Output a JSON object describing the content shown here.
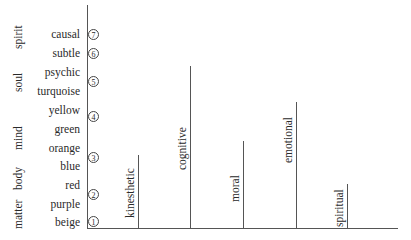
{
  "diagram": {
    "type": "integral-psychograph",
    "quadrants": [
      {
        "label": "spirit",
        "y_top": 7,
        "y_bottom": 6
      },
      {
        "label": "soul",
        "y_top": 5,
        "y_bottom": 5
      },
      {
        "label": "mind",
        "y_top": 4,
        "y_bottom": 3
      },
      {
        "label": "body",
        "y_top": 3,
        "y_bottom": 3
      },
      {
        "label": "matter",
        "y_top": 2,
        "y_bottom": 1
      }
    ],
    "levels": [
      {
        "label": "causal",
        "number": "7"
      },
      {
        "label": "subtle",
        "number": "6"
      },
      {
        "label": "psychic",
        "number": "5"
      },
      {
        "label": "turquoise",
        "number": ""
      },
      {
        "label": "yellow",
        "number": "4"
      },
      {
        "label": "green",
        "number": ""
      },
      {
        "label": "orange",
        "number": "3"
      },
      {
        "label": "blue",
        "number": ""
      },
      {
        "label": "red",
        "number": "2"
      },
      {
        "label": "purple",
        "number": ""
      },
      {
        "label": "beige",
        "number": "1"
      }
    ],
    "numbers": [
      "1",
      "2",
      "3",
      "4",
      "5",
      "6",
      "7"
    ],
    "lines": [
      {
        "label": "kinesthetic",
        "height_pct": 33
      },
      {
        "label": "cognitive",
        "height_pct": 73
      },
      {
        "label": "moral",
        "height_pct": 39
      },
      {
        "label": "emotional",
        "height_pct": 56
      },
      {
        "label": "spiritual",
        "height_pct": 19
      }
    ]
  },
  "labels": {
    "quad_spirit": "spirit",
    "quad_soul": "soul",
    "quad_mind": "mind",
    "quad_body": "body",
    "quad_matter": "matter",
    "lvl_causal": "causal",
    "lvl_subtle": "subtle",
    "lvl_psychic": "psychic",
    "lvl_turquoise": "turquoise",
    "lvl_yellow": "yellow",
    "lvl_green": "green",
    "lvl_orange": "orange",
    "lvl_blue": "blue",
    "lvl_red": "red",
    "lvl_purple": "purple",
    "lvl_beige": "beige",
    "n1": "1",
    "n2": "2",
    "n3": "3",
    "n4": "4",
    "n5": "5",
    "n6": "6",
    "n7": "7",
    "line_kinesthetic": "kinesthetic",
    "line_cognitive": "cognitive",
    "line_moral": "moral",
    "line_emotional": "emotional",
    "line_spiritual": "spiritual"
  }
}
